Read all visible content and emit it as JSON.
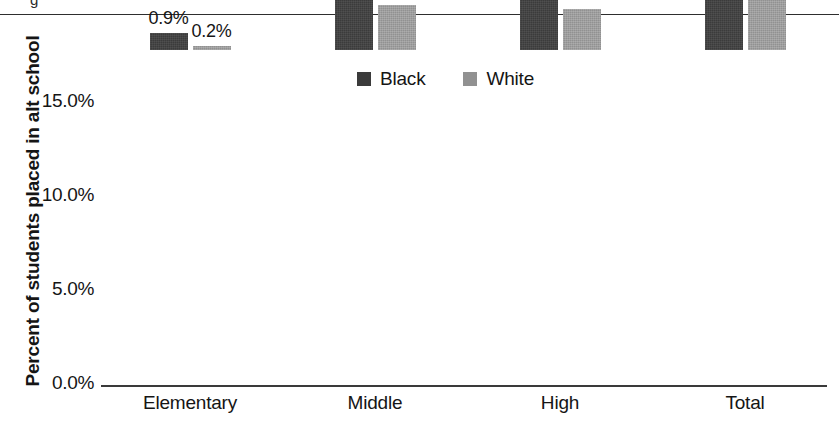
{
  "page": {
    "clipped_glyph": "g"
  },
  "chart_data": {
    "type": "bar",
    "title": "",
    "xlabel": "",
    "ylabel": "Percent of students placed in alt school",
    "categories": [
      "Elementary",
      "Middle",
      "High",
      "Total"
    ],
    "series": [
      {
        "name": "Black",
        "color": "#3b3b3b",
        "values": [
          0.9,
          6.3,
          8.7,
          13.1
        ],
        "labels": [
          "0.9%",
          "6.3%",
          "8.7%",
          "13.1%"
        ]
      },
      {
        "name": "White",
        "color": "#919191",
        "values": [
          0.2,
          2.4,
          2.2,
          3.8
        ],
        "labels": [
          "0.2%",
          "2.4%",
          "2.2%",
          "3.8%"
        ]
      }
    ],
    "ylim": [
      0,
      17.6
    ],
    "yticks": [
      0,
      5,
      10,
      15
    ],
    "ytick_labels": [
      "0.0%",
      "5.0%",
      "10.0%",
      "15.0%"
    ],
    "grid": false,
    "legend_position": "top-center",
    "legend": [
      "Black",
      "White"
    ]
  }
}
